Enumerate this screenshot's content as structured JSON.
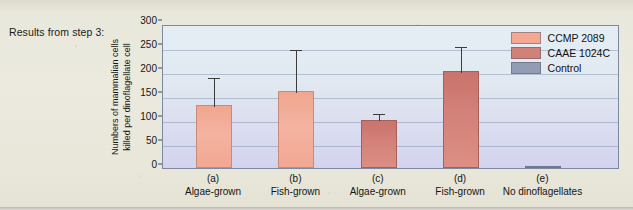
{
  "caption": "Results from step 3:",
  "colors": {
    "ccmp": "#f2a893",
    "caae": "#d2807a",
    "control": "#929cb5",
    "plot_top": "#e4eef4",
    "plot_bottom": "#d4d3ee",
    "page_bg": "#eceadf",
    "axis": "#7b8aa0"
  },
  "chart_data": {
    "type": "bar",
    "title": "",
    "xlabel": "",
    "ylabel": "Numbers of mammalian cells killed per dinoflagellate cell",
    "ylabel_lines": [
      "Numbers of mammalian cells",
      "killed per dinoflagellate cell"
    ],
    "ylim": [
      0,
      300
    ],
    "yticks": [
      0,
      50,
      100,
      150,
      200,
      250,
      300
    ],
    "grid": true,
    "legend_position": "top-right",
    "categories": [
      "(a)",
      "(b)",
      "(c)",
      "(d)",
      "(e)"
    ],
    "category_names": [
      "Algae-grown",
      "Fish-grown",
      "Algae-grown",
      "Fish-grown",
      "No dinoflagellates"
    ],
    "values": [
      130,
      160,
      100,
      202,
      1
    ],
    "error_high": [
      190,
      250,
      115,
      255,
      1
    ],
    "series_of_bar": [
      "CCMP 2089",
      "CCMP 2089",
      "CAAE 1024C",
      "CAAE 1024C",
      "Control"
    ],
    "legend": [
      {
        "label": "CCMP 2089",
        "color": "#f2a893"
      },
      {
        "label": "CAAE 1024C",
        "color": "#d2807a"
      },
      {
        "label": "Control",
        "color": "#929cb5"
      }
    ]
  }
}
